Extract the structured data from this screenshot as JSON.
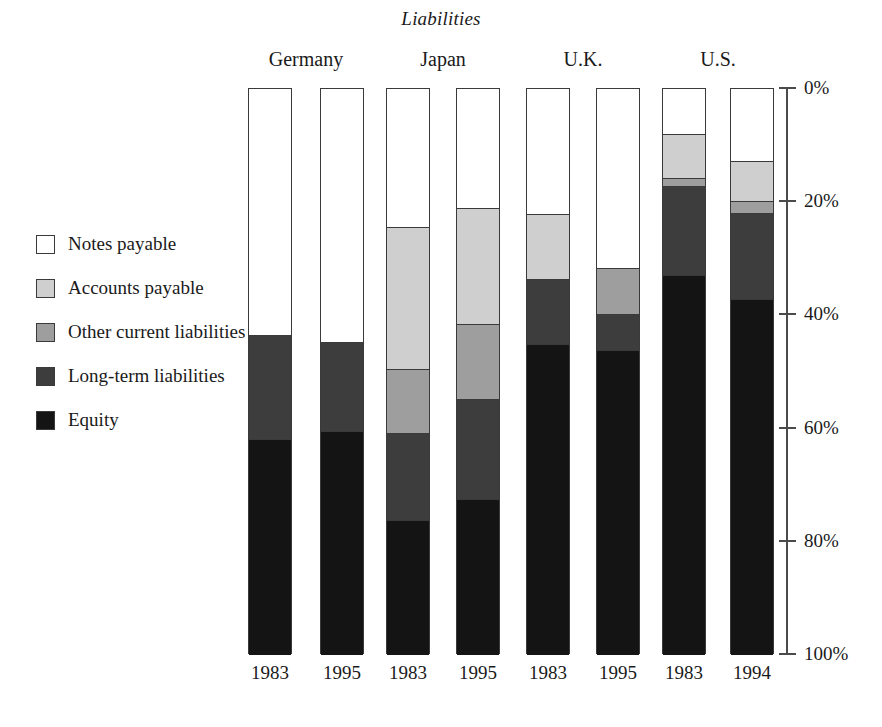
{
  "chart_data": {
    "type": "bar",
    "title": "Liabilities",
    "xlabel": "",
    "ylabel": "",
    "ylim": [
      0,
      100
    ],
    "y_tick_labels": [
      "0%",
      "20%",
      "40%",
      "60%",
      "80%",
      "100%"
    ],
    "y_ticks": [
      0,
      20,
      40,
      60,
      80,
      100
    ],
    "y_axis_inverted": true,
    "grid": false,
    "legend_position": "left",
    "stacked": true,
    "groups": [
      "Germany",
      "Japan",
      "U.K.",
      "U.S."
    ],
    "categories": [
      "1983",
      "1995",
      "1983",
      "1995",
      "1983",
      "1995",
      "1983",
      "1994"
    ],
    "series": [
      {
        "name": "Notes payable",
        "color": "#ffffff",
        "values": [
          43.5,
          44.7,
          24.4,
          21.0,
          22.1,
          31.7,
          8.0,
          12.7
        ]
      },
      {
        "name": "Accounts payable",
        "color": "#cfcfcf",
        "values": [
          0.0,
          0.0,
          25.1,
          20.5,
          11.5,
          0.0,
          7.8,
          7.1
        ]
      },
      {
        "name": "Other current liabilities",
        "color": "#9e9e9e",
        "values": [
          0.0,
          0.0,
          11.3,
          13.3,
          0.0,
          8.0,
          1.4,
          2.1
        ]
      },
      {
        "name": "Long-term liabilities",
        "color": "#3d3d3d",
        "values": [
          18.4,
          15.7,
          15.4,
          17.7,
          11.5,
          6.4,
          15.6,
          15.2
        ]
      },
      {
        "name": "Equity",
        "color": "#141414",
        "values": [
          38.1,
          39.6,
          23.8,
          27.5,
          54.9,
          53.9,
          67.2,
          62.9
        ]
      }
    ]
  },
  "legend": {
    "items": [
      {
        "label": "Notes payable",
        "color": "#ffffff"
      },
      {
        "label": "Accounts payable",
        "color": "#cfcfcf"
      },
      {
        "label": "Other current liabilities",
        "color": "#9e9e9e"
      },
      {
        "label": "Long-term liabilities",
        "color": "#3d3d3d"
      },
      {
        "label": "Equity",
        "color": "#141414"
      }
    ]
  }
}
